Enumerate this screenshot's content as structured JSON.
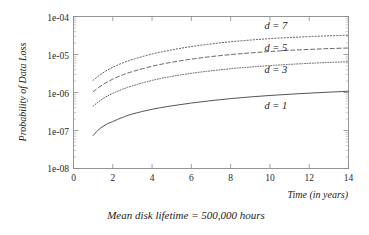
{
  "chart_data": {
    "type": "line",
    "title": "",
    "subtitle": "",
    "caption": "Mean disk lifetime = 500,000 hours",
    "xlabel": "Time (in years)",
    "ylabel": "Probability of Data Loss",
    "xscale": "linear",
    "yscale": "log",
    "xlim": [
      0,
      14
    ],
    "ylim": [
      1e-08,
      0.0001
    ],
    "grid": false,
    "legend_position": "inline-right",
    "xticks": [
      0,
      2,
      4,
      6,
      8,
      10,
      12,
      14
    ],
    "xtick_labels": [
      "0",
      "2",
      "4",
      "6",
      "8",
      "10",
      "12",
      "14"
    ],
    "yticks": [
      1e-08,
      1e-07,
      1e-06,
      1e-05,
      0.0001
    ],
    "ytick_labels": [
      "1e-08",
      "1e-07",
      "1e-06",
      "1e-05",
      "1e-04"
    ],
    "series": [
      {
        "name": "d = 7",
        "label": "d = 7",
        "style": "dotted",
        "x": [
          1,
          1.5,
          2,
          2.5,
          3,
          4,
          5,
          6,
          7,
          8,
          9,
          10,
          11,
          12,
          13,
          14
        ],
        "values": [
          2.1e-06,
          3.3e-06,
          4.6e-06,
          6e-06,
          7.4e-06,
          1.03e-05,
          1.32e-05,
          1.62e-05,
          1.9e-05,
          2.16e-05,
          2.4e-05,
          2.62e-05,
          2.8e-05,
          2.96e-05,
          3.1e-05,
          3.22e-05
        ]
      },
      {
        "name": "d = 5",
        "label": "d = 5",
        "style": "dashed",
        "x": [
          1,
          1.5,
          2,
          2.5,
          3,
          4,
          5,
          6,
          7,
          8,
          9,
          10,
          11,
          12,
          13,
          14
        ],
        "values": [
          1.05e-06,
          1.62e-06,
          2.25e-06,
          2.9e-06,
          3.55e-06,
          4.9e-06,
          6.25e-06,
          7.55e-06,
          8.8e-06,
          9.95e-06,
          1.1e-05,
          1.2e-05,
          1.29e-05,
          1.36e-05,
          1.43e-05,
          1.48e-05
        ]
      },
      {
        "name": "d = 3",
        "label": "d = 3",
        "style": "dotted-fine",
        "x": [
          1,
          1.5,
          2,
          2.5,
          3,
          4,
          5,
          6,
          7,
          8,
          9,
          10,
          11,
          12,
          13,
          14
        ],
        "values": [
          4.4e-07,
          6.9e-07,
          9.5e-07,
          1.22e-06,
          1.5e-06,
          2.08e-06,
          2.65e-06,
          3.2e-06,
          3.72e-06,
          4.22e-06,
          4.68e-06,
          5.1e-06,
          5.5e-06,
          5.85e-06,
          6.18e-06,
          6.45e-06
        ]
      },
      {
        "name": "d = 1",
        "label": "d = 1",
        "style": "solid",
        "x": [
          1,
          1.25,
          1.5,
          1.75,
          2,
          2.5,
          3,
          4,
          5,
          6,
          7,
          8,
          9,
          10,
          11,
          12,
          13,
          14
        ],
        "values": [
          7.4e-08,
          1.02e-07,
          1.28e-07,
          1.52e-07,
          1.72e-07,
          2.22e-07,
          2.72e-07,
          3.62e-07,
          4.45e-07,
          5.28e-07,
          6.1e-07,
          6.9e-07,
          7.65e-07,
          8.35e-07,
          9e-07,
          9.6e-07,
          1.02e-06,
          1.08e-06
        ]
      }
    ],
    "annotations": [
      {
        "text": "d = 7",
        "x": 10.3,
        "y": 4.6e-05
      },
      {
        "text": "d = 5",
        "x": 10.3,
        "y": 1.25e-05
      },
      {
        "text": "d = 3",
        "x": 10.3,
        "y": 3.3e-06
      },
      {
        "text": "d = 1",
        "x": 10.3,
        "y": 3.6e-07
      }
    ]
  },
  "axes": {
    "ylabel": "Probability of Data Loss",
    "xlabel": "Time (in years)",
    "ytick_0": "1e-04",
    "ytick_1": "1e-05",
    "ytick_2": "1e-06",
    "ytick_3": "1e-07",
    "ytick_4": "1e-08",
    "xtick_0": "0",
    "xtick_1": "2",
    "xtick_2": "4",
    "xtick_3": "6",
    "xtick_4": "8",
    "xtick_5": "10",
    "xtick_6": "12",
    "xtick_7": "14"
  },
  "labels": {
    "d7": "d = 7",
    "d5": "d = 5",
    "d3": "d = 3",
    "d1": "d = 1"
  },
  "caption": "Mean disk lifetime = 500,000 hours"
}
